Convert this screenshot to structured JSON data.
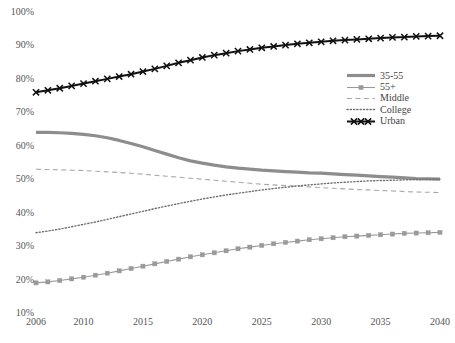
{
  "chart_data": {
    "type": "line",
    "title": "",
    "xlabel": "",
    "ylabel": "",
    "xlim": [
      2006,
      2040
    ],
    "ylim": [
      10,
      100
    ],
    "grid": false,
    "legend_position": "right-upper",
    "x_tick_labels": [
      "2006",
      "2010",
      "2015",
      "2020",
      "2025",
      "2030",
      "2035",
      "2040"
    ],
    "x_tick_values": [
      2006,
      2010,
      2015,
      2020,
      2025,
      2030,
      2035,
      2040
    ],
    "y_tick_labels": [
      "10%",
      "20%",
      "30%",
      "40%",
      "50%",
      "60%",
      "70%",
      "80%",
      "90%",
      "100%"
    ],
    "y_tick_values": [
      10,
      20,
      30,
      40,
      50,
      60,
      70,
      80,
      90,
      100
    ],
    "x": [
      2006,
      2007,
      2008,
      2009,
      2010,
      2011,
      2012,
      2013,
      2014,
      2015,
      2016,
      2017,
      2018,
      2019,
      2020,
      2021,
      2022,
      2023,
      2024,
      2025,
      2026,
      2027,
      2028,
      2029,
      2030,
      2031,
      2032,
      2033,
      2034,
      2035,
      2036,
      2037,
      2038,
      2039,
      2040
    ],
    "series": [
      {
        "name": "35-55",
        "color": "#8d8d8d",
        "style": "solid",
        "width": 3.2,
        "marker": "none",
        "values": [
          64.0,
          64.0,
          63.9,
          63.7,
          63.4,
          63.0,
          62.4,
          61.6,
          60.7,
          59.7,
          58.6,
          57.5,
          56.4,
          55.5,
          54.8,
          54.2,
          53.7,
          53.3,
          53.0,
          52.7,
          52.5,
          52.3,
          52.1,
          51.9,
          51.8,
          51.6,
          51.4,
          51.2,
          51.0,
          50.8,
          50.6,
          50.4,
          50.2,
          50.1,
          50.0
        ]
      },
      {
        "name": "55+",
        "color": "#9a9a9a",
        "style": "solid",
        "width": 1.1,
        "marker": "square",
        "values": [
          19.0,
          19.3,
          19.7,
          20.2,
          20.7,
          21.3,
          21.9,
          22.6,
          23.3,
          24.0,
          24.7,
          25.4,
          26.1,
          26.8,
          27.4,
          28.0,
          28.6,
          29.2,
          29.7,
          30.2,
          30.7,
          31.1,
          31.5,
          31.9,
          32.2,
          32.5,
          32.8,
          33.0,
          33.2,
          33.4,
          33.6,
          33.8,
          33.9,
          34.0,
          34.1
        ]
      },
      {
        "name": "Middle",
        "color": "#a8a8a8",
        "style": "dashed",
        "width": 1.1,
        "marker": "none",
        "values": [
          53.0,
          52.9,
          52.8,
          52.7,
          52.6,
          52.4,
          52.2,
          52.0,
          51.8,
          51.5,
          51.2,
          50.9,
          50.6,
          50.3,
          50.0,
          49.7,
          49.4,
          49.1,
          48.8,
          48.5,
          48.3,
          48.1,
          47.9,
          47.7,
          47.5,
          47.3,
          47.1,
          46.9,
          46.8,
          46.6,
          46.5,
          46.3,
          46.2,
          46.1,
          46.0
        ]
      },
      {
        "name": "College",
        "color": "#707070",
        "style": "dotted",
        "width": 1.4,
        "marker": "none",
        "values": [
          34.0,
          34.5,
          35.1,
          35.8,
          36.5,
          37.2,
          38.0,
          38.8,
          39.6,
          40.4,
          41.2,
          42.0,
          42.7,
          43.4,
          44.1,
          44.7,
          45.3,
          45.8,
          46.3,
          46.8,
          47.2,
          47.6,
          48.0,
          48.3,
          48.6,
          48.9,
          49.1,
          49.3,
          49.5,
          49.6,
          49.7,
          49.8,
          49.9,
          50.0,
          50.0
        ]
      },
      {
        "name": "Urban",
        "color": "#111111",
        "style": "solid",
        "width": 2.0,
        "marker": "x",
        "values": [
          76.0,
          76.6,
          77.2,
          77.9,
          78.6,
          79.3,
          80.0,
          80.7,
          81.4,
          82.2,
          83.0,
          83.9,
          84.8,
          85.6,
          86.4,
          87.1,
          87.7,
          88.3,
          88.8,
          89.3,
          89.7,
          90.1,
          90.5,
          90.8,
          91.1,
          91.4,
          91.6,
          91.8,
          92.0,
          92.2,
          92.4,
          92.5,
          92.7,
          92.8,
          92.9
        ]
      }
    ]
  },
  "legend": {
    "items": [
      {
        "label": "35-55"
      },
      {
        "label": "55+"
      },
      {
        "label": "Middle"
      },
      {
        "label": "College"
      },
      {
        "label": "Urban"
      }
    ]
  }
}
